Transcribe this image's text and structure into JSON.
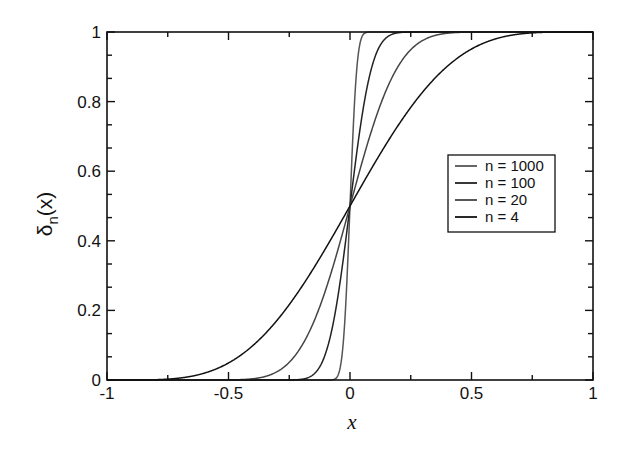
{
  "chart_data": {
    "type": "line",
    "title": "",
    "xlabel": "x",
    "ylabel": "δn(x)",
    "ylabel_main": "δ",
    "ylabel_sub": "n",
    "ylabel_tail": "(x)",
    "xlim": [
      -1,
      1
    ],
    "ylim": [
      0,
      1
    ],
    "grid": false,
    "legend_position": "center-right",
    "x_ticks": [
      -1,
      -0.5,
      0,
      0.5,
      1
    ],
    "x_tick_labels": [
      "-1",
      "-0.5",
      "0",
      "0.5",
      "1"
    ],
    "x_minor_ticks": [
      -0.75,
      -0.25,
      0.25,
      0.75
    ],
    "y_ticks": [
      0,
      0.2,
      0.4,
      0.6,
      0.8,
      1
    ],
    "y_tick_labels": [
      "0",
      "0.2",
      "0.4",
      "0.6",
      "0.8",
      "1"
    ],
    "series": [
      {
        "name": "n = 1000",
        "n": 1000,
        "color": "#555555",
        "x": [
          -1,
          -0.1,
          -0.05,
          -0.03,
          -0.02,
          -0.01,
          0,
          0.01,
          0.02,
          0.03,
          0.05,
          0.1,
          1
        ],
        "values": [
          0,
          0.0,
          0.001,
          0.02,
          0.1,
          0.26,
          0.5,
          0.74,
          0.9,
          0.98,
          0.999,
          1.0,
          1
        ]
      },
      {
        "name": "n = 100",
        "n": 100,
        "color": "#222222",
        "x": [
          -1,
          -0.3,
          -0.2,
          -0.15,
          -0.1,
          -0.05,
          0,
          0.05,
          0.1,
          0.15,
          0.2,
          0.3,
          1
        ],
        "values": [
          0,
          0.0,
          0.002,
          0.02,
          0.08,
          0.24,
          0.5,
          0.76,
          0.92,
          0.98,
          0.998,
          1.0,
          1
        ]
      },
      {
        "name": "n = 20",
        "n": 20,
        "color": "#444444",
        "x": [
          -1,
          -0.5,
          -0.4,
          -0.3,
          -0.2,
          -0.1,
          0,
          0.1,
          0.2,
          0.3,
          0.4,
          0.5,
          1
        ],
        "values": [
          0,
          0.002,
          0.01,
          0.04,
          0.12,
          0.27,
          0.5,
          0.73,
          0.88,
          0.96,
          0.99,
          0.998,
          1
        ]
      },
      {
        "name": "n = 4",
        "n": 4,
        "color": "#111111",
        "x": [
          -1,
          -0.75,
          -0.5,
          -0.25,
          0,
          0.25,
          0.5,
          0.75,
          1
        ],
        "values": [
          0,
          0.01,
          0.08,
          0.25,
          0.5,
          0.75,
          0.92,
          0.99,
          1
        ]
      }
    ]
  }
}
